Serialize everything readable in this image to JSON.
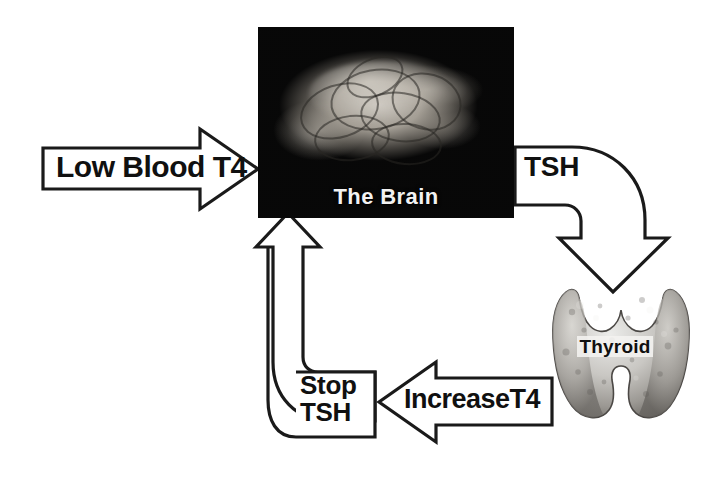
{
  "diagram": {
    "background_color": "#ffffff",
    "line_color": "#1a1a1a",
    "nodes": [
      {
        "id": "brain",
        "name": "The Brain",
        "label": "The Brain",
        "kind": "photo-panel",
        "panel_color": "#050505",
        "label_color": "#f2f2f2"
      },
      {
        "id": "thyroid",
        "name": "Thyroid",
        "label": "Thyroid",
        "kind": "photo-shape",
        "label_color": "#101010"
      }
    ],
    "arrows": [
      {
        "id": "low-blood-t4",
        "label": "Low Blood T4",
        "direction": "right",
        "from": "blood",
        "to": "brain",
        "style": "block-arrow"
      },
      {
        "id": "tsh",
        "label": "TSH",
        "direction": "down",
        "from": "brain",
        "to": "thyroid",
        "style": "curved-block-arrow"
      },
      {
        "id": "increase-t4",
        "label": "IncreaseT4",
        "direction": "left",
        "from": "thyroid",
        "to": "stop-tsh",
        "style": "block-arrow"
      },
      {
        "id": "stop-tsh",
        "label_line1": "Stop",
        "label_line2": "TSH",
        "direction": "up",
        "from": "thyroid",
        "to": "brain",
        "style": "curved-block-arrow"
      }
    ]
  }
}
